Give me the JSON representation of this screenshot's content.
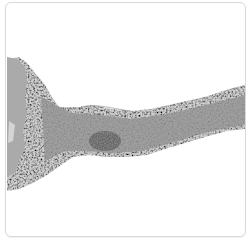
{
  "image": {
    "alt": "Grayscale histology micrograph of a tissue strip extending from a dense region on the left toward the right edge",
    "colors": {
      "background": "#ffffff",
      "frame_border": "#d9d9d9",
      "dense_region": "#a9a9a9",
      "tissue_base": "#c8c8c8",
      "nuclei_dark": "#4a4a4a"
    }
  }
}
